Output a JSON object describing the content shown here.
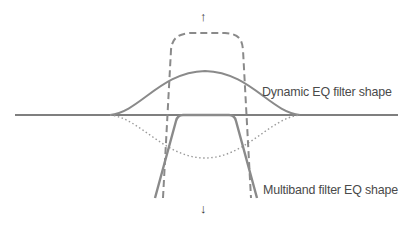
{
  "labels": {
    "dynamic_eq": "Dynamic EQ filter shape",
    "multiband": "Multiband filter EQ shape"
  },
  "arrows": {
    "up": "↑",
    "down": "↓"
  },
  "colors": {
    "baseline": "#555555",
    "curve": "#8a8a8a",
    "dashed": "#8a8a8a",
    "dotted": "#9a9a9a",
    "text": "#4a4a4a"
  }
}
